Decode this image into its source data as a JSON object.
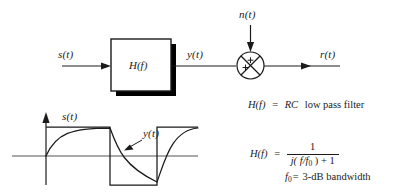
{
  "figure": {
    "type": "block-diagram-with-waveform",
    "background_color": "#ffffff",
    "line_color": "#1a1a1a",
    "shadow_color": "#000000"
  },
  "block_diagram": {
    "input_label": "s(t)",
    "filter_block_label": "H(f)",
    "filter_output_label": "y(t)",
    "noise_label": "n(t)",
    "output_label": "r(t)",
    "summer": {
      "symbol": "circle-with-x",
      "sign_top": "+",
      "sign_left": "+"
    }
  },
  "waveform": {
    "input_wave_label": "s(t)",
    "output_wave_label": "y(t)",
    "input_wave_type": "square",
    "output_wave_type": "rc-exponential-response",
    "axis_vertical": "amplitude",
    "axis_horizontal": "time"
  },
  "equations": {
    "line1": {
      "lhs": "H(f)",
      "eq": "=",
      "rhs_italic": "RC",
      "rhs_roman": "low pass filter"
    },
    "line2": {
      "lhs": "H(f)",
      "eq": "=",
      "numerator": "1",
      "denominator_j": "j",
      "denominator_rest": "( f/f",
      "denominator_sub": "0",
      "denominator_tail": " ) + 1"
    },
    "line3": {
      "symbol": "f",
      "symbol_sub": "0",
      "eq": "=",
      "text": "3-dB bandwidth"
    }
  },
  "caption": {
    "text": ""
  }
}
